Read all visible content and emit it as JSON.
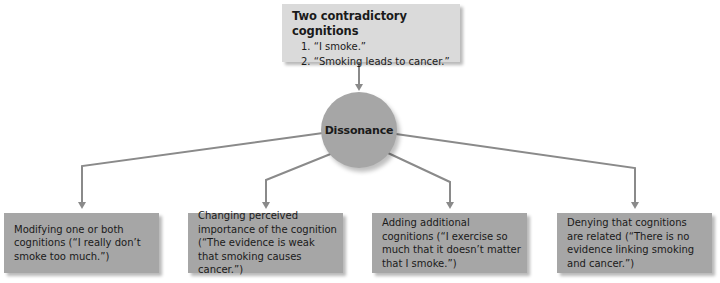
{
  "diagram": {
    "top_box": {
      "title": "Two contradictory cognitions",
      "items": [
        "1. “I smoke.”",
        "2. “Smoking leads to cancer.”"
      ]
    },
    "center": {
      "label": "Dissonance"
    },
    "strategies": [
      {
        "text": "Modifying one or both cognitions (“I really don’t smoke too much.”)"
      },
      {
        "text": "Changing perceived importance of the cognition (“The evidence is weak that smoking causes cancer.”)"
      },
      {
        "text": "Adding additional cognitions (“I exercise so much that it doesn’t matter that I smoke.”)"
      },
      {
        "text": "Denying that cognitions are related (“There is no evidence linking smoking and cancer.”)"
      }
    ],
    "colors": {
      "top_box_fill": "#dadada",
      "node_fill": "#a6a6a6",
      "connector": "#8a8a8a",
      "text": "#1a1a1a"
    }
  }
}
